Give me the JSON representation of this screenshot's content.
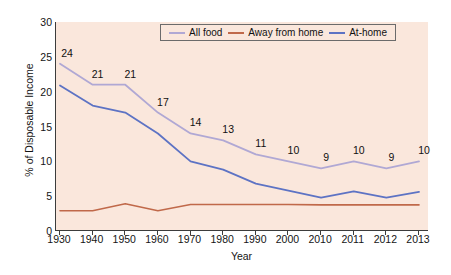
{
  "chart_data": {
    "type": "line",
    "title": "",
    "xlabel": "Year",
    "ylabel": "% of Disposable Income",
    "categories": [
      "1930",
      "1940",
      "1950",
      "1960",
      "1970",
      "1980",
      "1990",
      "2000",
      "2010",
      "2011",
      "2012",
      "2013"
    ],
    "ylim": [
      0,
      30
    ],
    "yticks": [
      "0",
      "5",
      "10",
      "15",
      "20",
      "25",
      "30"
    ],
    "grid": false,
    "legend_position": "top-center",
    "series": [
      {
        "name": "All food",
        "color": "#b0a8d4",
        "values": [
          24.0,
          21.0,
          21.0,
          17.0,
          14.0,
          13.0,
          11.0,
          10.0,
          9.0,
          10.0,
          9.0,
          10.0
        ],
        "point_labels": [
          "24",
          "21",
          "21",
          "17",
          "14",
          "13",
          "11",
          "10",
          "9",
          "10",
          "9",
          "10"
        ]
      },
      {
        "name": "Away from home",
        "color": "#c0694a",
        "values": [
          2.9,
          2.9,
          3.9,
          2.9,
          3.8,
          3.8,
          3.8,
          3.8,
          3.75,
          3.75,
          3.75,
          3.75
        ],
        "point_labels": []
      },
      {
        "name": "At-home",
        "color": "#5d73c4",
        "values": [
          20.9,
          18.0,
          17.0,
          14.0,
          10.0,
          8.8,
          6.8,
          5.8,
          4.8,
          5.7,
          4.8,
          5.6
        ],
        "point_labels": []
      }
    ]
  },
  "plot": {
    "background_color": "#fae7dc",
    "axis_color": "#3c3c3c"
  }
}
